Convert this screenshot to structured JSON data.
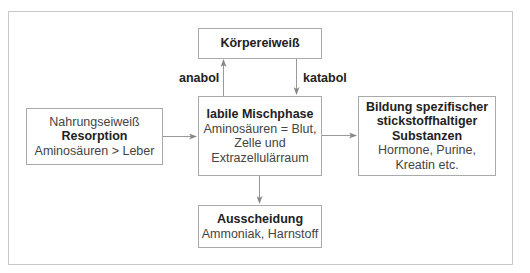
{
  "diagram": {
    "nodes": {
      "koerpereiweiss": {
        "title": "Körpereiweiß"
      },
      "mischphase": {
        "title": "labile Mischphase",
        "lines": [
          "Aminosäuren = Blut,",
          "Zelle und",
          "Extrazellulärraum"
        ]
      },
      "nahrung": {
        "pre": "Nahrungseiweiß",
        "title": "Resorption",
        "lines": [
          "Aminosäuren > Leber"
        ]
      },
      "bildung": {
        "title_lines": [
          "Bildung spezifischer",
          "stickstoffhaltiger",
          "Substanzen"
        ],
        "lines": [
          "Hormone, Purine,",
          "Kreatin etc."
        ]
      },
      "ausscheidung": {
        "title": "Ausscheidung",
        "lines": [
          "Ammoniak, Harnstoff"
        ]
      }
    },
    "edge_labels": {
      "anabol": "anabol",
      "katabol": "katabol"
    },
    "edges": [
      {
        "from": "nahrung",
        "to": "mischphase"
      },
      {
        "from": "mischphase",
        "to": "koerpereiweiss",
        "label": "anabol"
      },
      {
        "from": "koerpereiweiss",
        "to": "mischphase",
        "label": "katabol"
      },
      {
        "from": "mischphase",
        "to": "bildung"
      },
      {
        "from": "mischphase",
        "to": "ausscheidung"
      }
    ],
    "colors": {
      "border": "#aaaaaa",
      "arrow": "#888888",
      "text": "#333333"
    }
  }
}
